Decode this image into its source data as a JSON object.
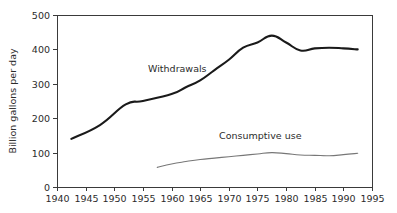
{
  "chart_data": {
    "type": "line",
    "title": "",
    "xlabel": "",
    "ylabel": "Billion gallons per day",
    "xlim": [
      1940,
      1995
    ],
    "ylim": [
      0,
      500
    ],
    "xticks": [
      1940,
      1945,
      1950,
      1955,
      1960,
      1965,
      1970,
      1975,
      1980,
      1985,
      1990,
      1995
    ],
    "yticks": [
      0,
      100,
      200,
      300,
      400,
      500
    ],
    "grid": false,
    "legend_position": "inline-annotation",
    "series": [
      {
        "name": "Withdrawals",
        "color": "#1a1a1a",
        "linewidth": 2.1,
        "x": [
          1942.5,
          1947.5,
          1952,
          1955,
          1960,
          1962.5,
          1965,
          1967.5,
          1970,
          1972.5,
          1975,
          1977.5,
          1980,
          1982.5,
          1985,
          1987.5,
          1990,
          1992.5
        ],
        "y": [
          140,
          180,
          240,
          250,
          270,
          290,
          310,
          340,
          370,
          405,
          420,
          440,
          420,
          397,
          403,
          405,
          403,
          400
        ]
      },
      {
        "name": "Consumptive use",
        "color": "#777777",
        "linewidth": 1.1,
        "x": [
          1957.5,
          1960,
          1962.5,
          1965,
          1967.5,
          1970,
          1972.5,
          1975,
          1977.5,
          1980,
          1982.5,
          1985,
          1987.5,
          1990,
          1992.5
        ],
        "y": [
          57,
          67,
          74,
          80,
          84,
          88,
          92,
          96,
          100,
          97,
          93,
          92,
          91,
          94,
          98
        ]
      }
    ],
    "annotations": [
      {
        "text": "Withdrawals",
        "x": 1961,
        "y": 335
      },
      {
        "text": "Consumptive use",
        "x": 1975.5,
        "y": 140
      }
    ]
  },
  "axes": {
    "y_title": "Billion gallons per day",
    "x_tick_labels": [
      "1940",
      "1945",
      "1950",
      "1955",
      "1960",
      "1965",
      "1970",
      "1975",
      "1980",
      "1985",
      "1990",
      "1995"
    ],
    "y_tick_labels": [
      "0",
      "100",
      "200",
      "300",
      "400",
      "500"
    ]
  },
  "labels": {
    "withdrawals": "Withdrawals",
    "consumptive_use": "Consumptive use"
  }
}
